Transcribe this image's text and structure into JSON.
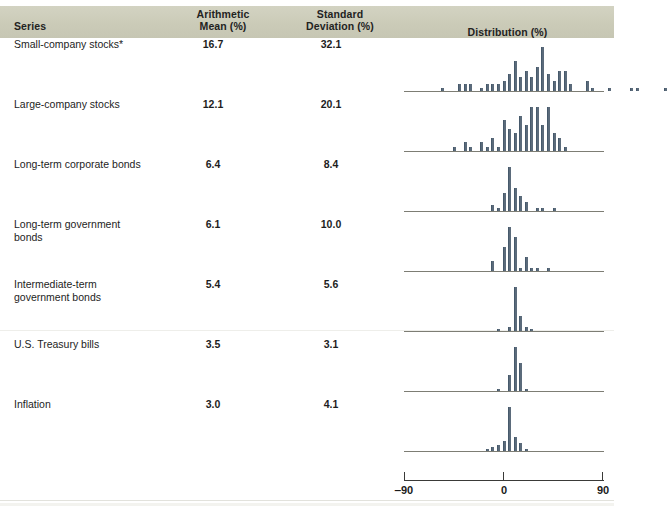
{
  "header": {
    "series_label": "Series",
    "mean_label": "Arithmetic\nMean (%)",
    "mean_label_l1": "Arithmetic",
    "mean_label_l2": "Mean (%)",
    "sd_label_l1": "Standard",
    "sd_label_l2": "Deviation (%)",
    "distribution_label": "Distribution (%)"
  },
  "axis": {
    "left_tick_label": "‒90",
    "center_tick_label": "0",
    "right_tick_label": "90",
    "min": -90,
    "max": 90
  },
  "rows": [
    {
      "series": "Small-company stocks*",
      "mean": "16.7",
      "sd": "32.1"
    },
    {
      "series": "Large-company stocks",
      "mean": "12.1",
      "sd": "20.1"
    },
    {
      "series": "Long-term corporate bonds",
      "mean": "6.4",
      "sd": "8.4"
    },
    {
      "series": "Long-term government\nbonds",
      "mean": "6.1",
      "sd": "10.0"
    },
    {
      "series": "Intermediate-term\ngovernment bonds",
      "mean": "5.4",
      "sd": "5.6"
    },
    {
      "series": "U.S. Treasury bills",
      "mean": "3.5",
      "sd": "3.1"
    },
    {
      "series": "Inflation",
      "mean": "3.0",
      "sd": "4.1"
    }
  ],
  "colors": {
    "header_band": "#cfcfbd",
    "bar": "#5b6b7b",
    "axis": "#7d7d74",
    "text": "#1d1d1d"
  },
  "chart_data": {
    "type": "bar",
    "title": "Distribution (%)",
    "xlabel": "Annual total return (%)",
    "ylabel": "Frequency (number of years)",
    "xlim": [
      -90,
      90
    ],
    "grid": false,
    "legend": null,
    "note": "Seven histograms of annual percent returns, one per series; each shares the -90 to 90 percent horizontal scale shown at the bottom. Bin centers are given in percent, values are counts of years.",
    "panels": [
      {
        "name": "Small-company stocks*",
        "mean": 16.7,
        "sd": 32.1,
        "bins": [
          -55,
          -50,
          -45,
          -40,
          -35,
          -30,
          -25,
          -20,
          -15,
          -10,
          -5,
          0,
          5,
          10,
          15,
          20,
          25,
          30,
          35,
          40,
          45,
          50,
          55,
          60,
          65,
          70,
          75,
          80,
          85,
          90,
          95,
          100,
          105,
          110,
          115,
          120,
          125,
          130,
          135,
          140,
          145
        ],
        "values": [
          1,
          0,
          0,
          2,
          2,
          2,
          0,
          1,
          2,
          2,
          2,
          3,
          5,
          9,
          4,
          6,
          4,
          7,
          13,
          5,
          3,
          6,
          6,
          2,
          0,
          0,
          3,
          1,
          0,
          0,
          1,
          0,
          0,
          0,
          1,
          1,
          0,
          0,
          0,
          0,
          1
        ]
      },
      {
        "name": "Large-company stocks",
        "mean": 12.1,
        "sd": 20.1,
        "bins": [
          -45,
          -40,
          -35,
          -30,
          -25,
          -20,
          -15,
          -10,
          -5,
          0,
          5,
          10,
          15,
          20,
          25,
          30,
          35,
          40,
          45,
          50,
          55
        ],
        "values": [
          1,
          0,
          2,
          1,
          0,
          2,
          1,
          3,
          1,
          7,
          5,
          4,
          8,
          6,
          10,
          10,
          6,
          10,
          4,
          3,
          1
        ]
      },
      {
        "name": "Long-term corporate bonds",
        "mean": 6.4,
        "sd": 8.4,
        "bins": [
          -10,
          -5,
          0,
          5,
          10,
          15,
          20,
          25,
          30,
          35,
          40,
          45
        ],
        "values": [
          2,
          1,
          6,
          15,
          8,
          5,
          3,
          0,
          1,
          1,
          0,
          1
        ]
      },
      {
        "name": "Long-term government bonds",
        "mean": 6.1,
        "sd": 10.0,
        "bins": [
          -10,
          -5,
          0,
          5,
          10,
          15,
          20,
          25,
          30,
          35,
          40
        ],
        "values": [
          3,
          0,
          7,
          13,
          10,
          1,
          4,
          1,
          1,
          0,
          1
        ]
      },
      {
        "name": "Intermediate-term government bonds",
        "mean": 5.4,
        "sd": 5.6,
        "bins": [
          -5,
          0,
          5,
          10,
          15,
          20,
          25
        ],
        "values": [
          1,
          0,
          2,
          24,
          8,
          2,
          1
        ]
      },
      {
        "name": "U.S. Treasury bills",
        "mean": 3.5,
        "sd": 3.1,
        "bins": [
          -5,
          0,
          5,
          10,
          15,
          20
        ],
        "values": [
          1,
          0,
          9,
          25,
          16,
          1
        ]
      },
      {
        "name": "Inflation",
        "mean": 3.0,
        "sd": 4.1,
        "bins": [
          -15,
          -10,
          -5,
          0,
          5,
          10,
          15,
          20
        ],
        "values": [
          1,
          2,
          3,
          5,
          22,
          7,
          4,
          1
        ]
      }
    ]
  }
}
